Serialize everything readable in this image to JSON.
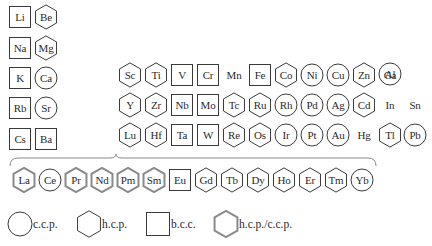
{
  "diagram": {
    "title": "",
    "colors": {
      "stroke": "#3a3a3a",
      "gray_stroke": "#8a8a8a",
      "text": "#2a2a2a"
    },
    "legend": [
      {
        "shape": "circle",
        "label": "c.c.p."
      },
      {
        "shape": "hexagon",
        "label": "h.c.p."
      },
      {
        "shape": "square",
        "label": "b.c.c."
      },
      {
        "shape": "hexagon-gray",
        "label": "h.c.p./c.c.p."
      }
    ],
    "elements": [
      {
        "symbol": "Li",
        "structure": "bcc",
        "x": 9,
        "y": 6
      },
      {
        "symbol": "Be",
        "structure": "hcp",
        "x": 35,
        "y": 6
      },
      {
        "symbol": "Na",
        "structure": "bcc",
        "x": 9,
        "y": 37
      },
      {
        "symbol": "Mg",
        "structure": "hcp",
        "x": 35,
        "y": 37
      },
      {
        "symbol": "K",
        "structure": "bcc",
        "x": 9,
        "y": 67
      },
      {
        "symbol": "Ca",
        "structure": "ccp",
        "x": 35,
        "y": 67
      },
      {
        "symbol": "Rb",
        "structure": "bcc",
        "x": 9,
        "y": 97
      },
      {
        "symbol": "Sr",
        "structure": "ccp",
        "x": 35,
        "y": 97
      },
      {
        "symbol": "Cs",
        "structure": "bcc",
        "x": 9,
        "y": 128
      },
      {
        "symbol": "Ba",
        "structure": "bcc",
        "x": 35,
        "y": 128
      },
      {
        "symbol": "Al",
        "structure": "ccp",
        "x": 379,
        "y": 63
      },
      {
        "symbol": "Sc",
        "structure": "hcp",
        "x": 119,
        "y": 64
      },
      {
        "symbol": "Ti",
        "structure": "hcp",
        "x": 145,
        "y": 64
      },
      {
        "symbol": "V",
        "structure": "bcc",
        "x": 171,
        "y": 64
      },
      {
        "symbol": "Cr",
        "structure": "bcc",
        "x": 197,
        "y": 64
      },
      {
        "symbol": "Mn",
        "structure": "none",
        "x": 223,
        "y": 64
      },
      {
        "symbol": "Fe",
        "structure": "bcc",
        "x": 249,
        "y": 64
      },
      {
        "symbol": "Co",
        "structure": "hcp",
        "x": 275,
        "y": 64
      },
      {
        "symbol": "Ni",
        "structure": "ccp",
        "x": 301,
        "y": 64
      },
      {
        "symbol": "Cu",
        "structure": "ccp",
        "x": 327,
        "y": 64
      },
      {
        "symbol": "Zn",
        "structure": "hcp",
        "x": 353,
        "y": 64
      },
      {
        "symbol": "Ga",
        "structure": "none",
        "x": 379,
        "y": 64
      },
      {
        "symbol": "Y",
        "structure": "hcp",
        "x": 119,
        "y": 94
      },
      {
        "symbol": "Zr",
        "structure": "hcp",
        "x": 145,
        "y": 94
      },
      {
        "symbol": "Nb",
        "structure": "bcc",
        "x": 171,
        "y": 94
      },
      {
        "symbol": "Mo",
        "structure": "bcc",
        "x": 197,
        "y": 94
      },
      {
        "symbol": "Tc",
        "structure": "hcp",
        "x": 223,
        "y": 94
      },
      {
        "symbol": "Ru",
        "structure": "hcp",
        "x": 249,
        "y": 94
      },
      {
        "symbol": "Rh",
        "structure": "ccp",
        "x": 275,
        "y": 94
      },
      {
        "symbol": "Pd",
        "structure": "ccp",
        "x": 301,
        "y": 94
      },
      {
        "symbol": "Ag",
        "structure": "ccp",
        "x": 327,
        "y": 94
      },
      {
        "symbol": "Cd",
        "structure": "hcp",
        "x": 353,
        "y": 94
      },
      {
        "symbol": "In",
        "structure": "none",
        "x": 379,
        "y": 94
      },
      {
        "symbol": "Sn",
        "structure": "none",
        "x": 404,
        "y": 94
      },
      {
        "symbol": "Lu",
        "structure": "hcp",
        "x": 119,
        "y": 124
      },
      {
        "symbol": "Hf",
        "structure": "hcp",
        "x": 145,
        "y": 124
      },
      {
        "symbol": "Ta",
        "structure": "bcc",
        "x": 171,
        "y": 124
      },
      {
        "symbol": "W",
        "structure": "bcc",
        "x": 197,
        "y": 124
      },
      {
        "symbol": "Re",
        "structure": "hcp",
        "x": 223,
        "y": 124
      },
      {
        "symbol": "Os",
        "structure": "hcp",
        "x": 249,
        "y": 124
      },
      {
        "symbol": "Ir",
        "structure": "ccp",
        "x": 275,
        "y": 124
      },
      {
        "symbol": "Pt",
        "structure": "ccp",
        "x": 301,
        "y": 124
      },
      {
        "symbol": "Au",
        "structure": "ccp",
        "x": 327,
        "y": 124
      },
      {
        "symbol": "Hg",
        "structure": "none",
        "x": 353,
        "y": 124
      },
      {
        "symbol": "Tl",
        "structure": "hcp",
        "x": 379,
        "y": 124
      },
      {
        "symbol": "Pb",
        "structure": "ccp",
        "x": 404,
        "y": 124
      },
      {
        "symbol": "La",
        "structure": "hcp-ccp",
        "x": 13,
        "y": 169
      },
      {
        "symbol": "Ce",
        "structure": "ccp",
        "x": 39,
        "y": 169
      },
      {
        "symbol": "Pr",
        "structure": "hcp-ccp",
        "x": 65,
        "y": 169
      },
      {
        "symbol": "Nd",
        "structure": "hcp-ccp",
        "x": 91,
        "y": 169
      },
      {
        "symbol": "Pm",
        "structure": "hcp-ccp",
        "x": 117,
        "y": 169
      },
      {
        "symbol": "Sm",
        "structure": "hcp-ccp",
        "x": 143,
        "y": 169
      },
      {
        "symbol": "Eu",
        "structure": "bcc",
        "x": 169,
        "y": 169
      },
      {
        "symbol": "Gd",
        "structure": "hcp",
        "x": 195,
        "y": 169
      },
      {
        "symbol": "Tb",
        "structure": "hcp",
        "x": 221,
        "y": 169
      },
      {
        "symbol": "Dy",
        "structure": "hcp",
        "x": 247,
        "y": 169
      },
      {
        "symbol": "Ho",
        "structure": "hcp",
        "x": 273,
        "y": 169
      },
      {
        "symbol": "Er",
        "structure": "hcp",
        "x": 299,
        "y": 169
      },
      {
        "symbol": "Tm",
        "structure": "hcp",
        "x": 325,
        "y": 169
      },
      {
        "symbol": "Yb",
        "structure": "ccp",
        "x": 351,
        "y": 169
      }
    ]
  }
}
